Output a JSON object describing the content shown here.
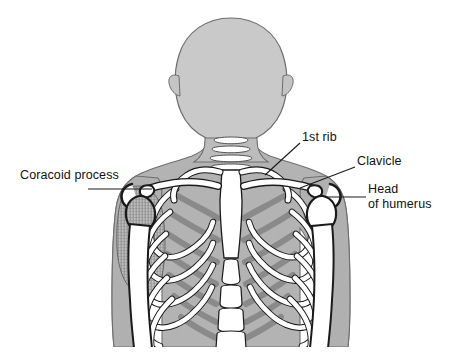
{
  "figure": {
    "background_color": "#ffffff",
    "width": 455,
    "height": 363
  },
  "palette": {
    "background": "#ffffff",
    "body_silhouette": "#b3b3b3",
    "head_silhouette": "#c9c9c9",
    "bone_fill": "#ffffff",
    "posterior_rib_gray": "#8a8a8a",
    "mid_shadow_gray": "#9c9c9c",
    "outline": "#1a1a1a",
    "soft_outline": "#6e6e6e",
    "label_text": "#111111",
    "leader_line": "#1a1a1a",
    "hatch_texture": "#7d7d7d"
  },
  "labels": [
    {
      "id": "coracoid-process",
      "text": "Coracoid process",
      "lines": [
        "Coracoid process"
      ],
      "side": "left",
      "align": "left",
      "text_x": 20,
      "text_y": 168,
      "leader": {
        "from_x": 88,
        "from_y": 189,
        "to_x": 152,
        "to_y": 189
      }
    },
    {
      "id": "first-rib",
      "text": "1st rib",
      "lines": [
        "1st rib"
      ],
      "side": "right",
      "align": "left",
      "text_x": 302,
      "text_y": 130,
      "leader": {
        "from_x": 300,
        "from_y": 143,
        "to_x": 265,
        "to_y": 175
      }
    },
    {
      "id": "clavicle",
      "text": "Clavicle",
      "lines": [
        "Clavicle"
      ],
      "side": "right",
      "align": "left",
      "text_x": 357,
      "text_y": 154,
      "leader": {
        "from_x": 355,
        "from_y": 167,
        "to_x": 300,
        "to_y": 188
      }
    },
    {
      "id": "head-of-humerus",
      "text": "Head of humerus",
      "lines": [
        "Head",
        "of humerus"
      ],
      "side": "right",
      "align": "left",
      "text_x": 368,
      "text_y": 182,
      "leader": {
        "from_x": 366,
        "from_y": 197,
        "to_x": 326,
        "to_y": 197
      }
    }
  ],
  "anatomy_parts": [
    {
      "id": "head",
      "name": "head-silhouette",
      "visible": true
    },
    {
      "id": "ear-left",
      "name": "ear-left",
      "visible": true
    },
    {
      "id": "ear-right",
      "name": "ear-right",
      "visible": true
    },
    {
      "id": "neck",
      "name": "neck-silhouette",
      "visible": true
    },
    {
      "id": "torso",
      "name": "torso-silhouette",
      "visible": true
    },
    {
      "id": "arm-left",
      "name": "arm-left-silhouette",
      "visible": true
    },
    {
      "id": "arm-right",
      "name": "arm-right-silhouette",
      "visible": true
    },
    {
      "id": "cervical-vertebrae",
      "name": "cervical-vertebrae",
      "visible": true
    },
    {
      "id": "clavicle-left",
      "name": "clavicle-left",
      "visible": true
    },
    {
      "id": "clavicle-right",
      "name": "clavicle-right",
      "visible": true
    },
    {
      "id": "first-rib-left",
      "name": "first-rib-left",
      "visible": true
    },
    {
      "id": "first-rib-right",
      "name": "first-rib-right",
      "visible": true
    },
    {
      "id": "sternum",
      "name": "sternum",
      "visible": true
    },
    {
      "id": "ribcage-left",
      "name": "ribcage-left",
      "visible": true
    },
    {
      "id": "ribcage-right",
      "name": "ribcage-right",
      "visible": true
    },
    {
      "id": "vertebral-column",
      "name": "vertebral-column",
      "visible": true
    },
    {
      "id": "scapula-left",
      "name": "scapula-left-hatched",
      "visible": true
    },
    {
      "id": "humerus-left",
      "name": "humerus-left",
      "visible": true
    },
    {
      "id": "humerus-right",
      "name": "humerus-right",
      "visible": true
    },
    {
      "id": "coracoid-left",
      "name": "coracoid-process-left",
      "visible": true
    },
    {
      "id": "coracoid-right",
      "name": "coracoid-process-right",
      "visible": true
    }
  ]
}
